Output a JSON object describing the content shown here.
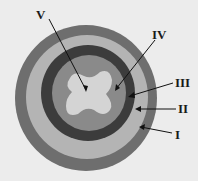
{
  "diagram": {
    "type": "cross-section",
    "labels": [
      {
        "id": "V",
        "text": "V",
        "x": 36,
        "y": 8,
        "target": "central-lumen"
      },
      {
        "id": "IV",
        "text": "IV",
        "x": 152,
        "y": 28,
        "target": "inner-lining-layer"
      },
      {
        "id": "III",
        "text": "III",
        "x": 175,
        "y": 76,
        "target": "dark-inner-ring"
      },
      {
        "id": "II",
        "text": "II",
        "x": 178,
        "y": 102,
        "target": "light-middle-ring"
      },
      {
        "id": "I",
        "text": "I",
        "x": 175,
        "y": 128,
        "target": "outer-ring"
      }
    ],
    "colors": {
      "background": "#ececec",
      "outer_ring": "#6e6e6e",
      "middle_ring": "#b4b4b4",
      "inner_dark_ring": "#3c3c3c",
      "inner_disk": "#8a8a8a",
      "lumen": "#d4d4d4",
      "leader_line": "#111111"
    }
  }
}
